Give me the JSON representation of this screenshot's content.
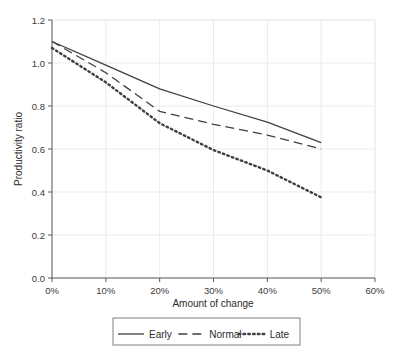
{
  "chart_data": {
    "type": "line",
    "title": "",
    "xlabel": "Amount of change",
    "ylabel": "Productivity ratio",
    "x": [
      0,
      10,
      20,
      30,
      40,
      50
    ],
    "xtick_labels": [
      "0%",
      "10%",
      "20%",
      "30%",
      "40%",
      "50%",
      "60%"
    ],
    "xtick_values": [
      0,
      10,
      20,
      30,
      40,
      50,
      60
    ],
    "ytick_labels": [
      "0.0",
      "0.2",
      "0.4",
      "0.6",
      "0.8",
      "1.0",
      "1.2"
    ],
    "ytick_values": [
      0.0,
      0.2,
      0.4,
      0.6,
      0.8,
      1.0,
      1.2
    ],
    "xlim": [
      0,
      60
    ],
    "ylim": [
      0,
      1.2
    ],
    "grid": true,
    "legend_position": "bottom",
    "series": [
      {
        "name": "Early",
        "style": "solid",
        "color": "#404040",
        "values": [
          1.1,
          0.99,
          0.88,
          0.8,
          0.725,
          0.63
        ]
      },
      {
        "name": "Normal",
        "style": "dashed",
        "color": "#404040",
        "values": [
          1.1,
          0.955,
          0.775,
          0.715,
          0.665,
          0.6
        ]
      },
      {
        "name": "Late",
        "style": "dotted",
        "color": "#404040",
        "values": [
          1.07,
          0.91,
          0.72,
          0.595,
          0.5,
          0.375
        ]
      }
    ]
  },
  "legend": {
    "items": [
      {
        "label": "Early"
      },
      {
        "label": "Normal"
      },
      {
        "label": "Late"
      }
    ]
  }
}
